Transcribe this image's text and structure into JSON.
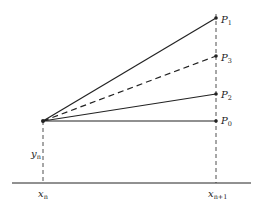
{
  "diagram": {
    "points": {
      "P1": {
        "label": "P",
        "sub": "1"
      },
      "P3": {
        "label": "P",
        "sub": "3"
      },
      "P2": {
        "label": "P",
        "sub": "2"
      },
      "P0": {
        "label": "P",
        "sub": "0"
      }
    },
    "y_label": {
      "label": "y",
      "sub": "n"
    },
    "x_left": {
      "label": "x",
      "sub": "n"
    },
    "x_right": {
      "label": "x",
      "sub": "n+1"
    },
    "colors": {
      "line": "#222222",
      "background": "#ffffff"
    }
  }
}
